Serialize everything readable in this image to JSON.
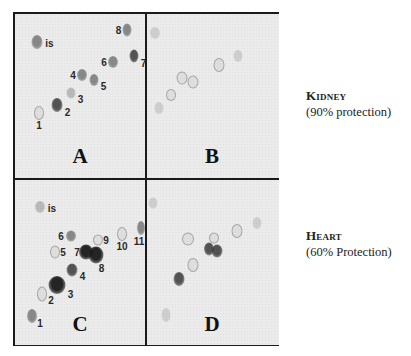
{
  "figure": {
    "panels": [
      {
        "label": "A",
        "spots": [
          {
            "id": "is",
            "label": "is",
            "x": 22,
            "y": 28,
            "w": 11,
            "h": 14,
            "shade": "medium"
          },
          {
            "id": "1",
            "label": "1",
            "x": 24,
            "y": 99,
            "w": 8,
            "h": 12,
            "shade": "ring"
          },
          {
            "id": "2",
            "label": "2",
            "x": 42,
            "y": 91,
            "w": 11,
            "h": 14,
            "shade": "dark"
          },
          {
            "id": "3",
            "label": "3",
            "x": 56,
            "y": 79,
            "w": 9,
            "h": 11,
            "shade": "light"
          },
          {
            "id": "4",
            "label": "4",
            "x": 67,
            "y": 61,
            "w": 10,
            "h": 12,
            "shade": "medium"
          },
          {
            "id": "5",
            "label": "5",
            "x": 79,
            "y": 66,
            "w": 9,
            "h": 12,
            "shade": "medium"
          },
          {
            "id": "6",
            "label": "6",
            "x": 98,
            "y": 48,
            "w": 10,
            "h": 12,
            "shade": "medium"
          },
          {
            "id": "7",
            "label": "7",
            "x": 119,
            "y": 42,
            "w": 9,
            "h": 13,
            "shade": "dark"
          },
          {
            "id": "8",
            "label": "8",
            "x": 112,
            "y": 16,
            "w": 9,
            "h": 13,
            "shade": "medium"
          }
        ]
      },
      {
        "label": "B",
        "spots": [
          {
            "x": 8,
            "y": 19,
            "w": 10,
            "h": 12,
            "shade": "faint"
          },
          {
            "x": 12,
            "y": 94,
            "w": 9,
            "h": 12,
            "shade": "faint"
          },
          {
            "x": 24,
            "y": 81,
            "w": 8,
            "h": 10,
            "shade": "ring"
          },
          {
            "x": 35,
            "y": 64,
            "w": 9,
            "h": 11,
            "shade": "ring"
          },
          {
            "x": 46,
            "y": 68,
            "w": 9,
            "h": 11,
            "shade": "ring"
          },
          {
            "x": 72,
            "y": 51,
            "w": 9,
            "h": 12,
            "shade": "ring"
          },
          {
            "x": 91,
            "y": 42,
            "w": 9,
            "h": 12,
            "shade": "faint"
          }
        ]
      },
      {
        "label": "C",
        "spots": [
          {
            "id": "is",
            "label": "is",
            "x": 25,
            "y": 27,
            "w": 10,
            "h": 12,
            "shade": "light"
          },
          {
            "id": "1",
            "label": "1",
            "x": 17,
            "y": 136,
            "w": 10,
            "h": 14,
            "shade": "medium"
          },
          {
            "id": "2",
            "label": "2",
            "x": 27,
            "y": 114,
            "w": 8,
            "h": 13,
            "shade": "ring"
          },
          {
            "id": "3",
            "label": "3",
            "x": 42,
            "y": 105,
            "w": 17,
            "h": 18,
            "shade": "black"
          },
          {
            "id": "4",
            "label": "4",
            "x": 57,
            "y": 90,
            "w": 11,
            "h": 13,
            "shade": "dark"
          },
          {
            "id": "5",
            "label": "5",
            "x": 40,
            "y": 72,
            "w": 8,
            "h": 11,
            "shade": "ring"
          },
          {
            "id": "6",
            "label": "6",
            "x": 56,
            "y": 56,
            "w": 10,
            "h": 11,
            "shade": "medium"
          },
          {
            "id": "7",
            "label": "7",
            "x": 71,
            "y": 72,
            "w": 14,
            "h": 15,
            "shade": "black"
          },
          {
            "id": "8",
            "label": "8",
            "x": 81,
            "y": 75,
            "w": 15,
            "h": 17,
            "shade": "black"
          },
          {
            "id": "9",
            "label": "9",
            "x": 83,
            "y": 60,
            "w": 8,
            "h": 9,
            "shade": "ring"
          },
          {
            "id": "10",
            "label": "10",
            "x": 107,
            "y": 54,
            "w": 8,
            "h": 12,
            "shade": "ring"
          },
          {
            "id": "11",
            "label": "11",
            "x": 126,
            "y": 48,
            "w": 8,
            "h": 14,
            "shade": "medium"
          }
        ]
      },
      {
        "label": "D",
        "spots": [
          {
            "x": 6,
            "y": 23,
            "w": 9,
            "h": 11,
            "shade": "faint"
          },
          {
            "x": 19,
            "y": 135,
            "w": 9,
            "h": 14,
            "shade": "faint"
          },
          {
            "x": 41,
            "y": 59,
            "w": 10,
            "h": 11,
            "shade": "ring"
          },
          {
            "x": 62,
            "y": 69,
            "w": 10,
            "h": 13,
            "shade": "dark"
          },
          {
            "x": 70,
            "y": 71,
            "w": 11,
            "h": 13,
            "shade": "dark"
          },
          {
            "x": 67,
            "y": 58,
            "w": 8,
            "h": 9,
            "shade": "ring"
          },
          {
            "x": 46,
            "y": 85,
            "w": 9,
            "h": 12,
            "shade": "ring"
          },
          {
            "x": 32,
            "y": 99,
            "w": 11,
            "h": 14,
            "shade": "dark"
          },
          {
            "x": 90,
            "y": 51,
            "w": 9,
            "h": 12,
            "shade": "ring"
          },
          {
            "x": 110,
            "y": 43,
            "w": 9,
            "h": 12,
            "shade": "faint"
          }
        ]
      }
    ],
    "captions": [
      {
        "title": "Kidney",
        "subtitle": "(90% protection)"
      },
      {
        "title": "Heart",
        "subtitle": "(60% Protection)"
      }
    ]
  },
  "shades": {
    "black": "rgba(20,20,20,0.92)",
    "dark": "rgba(45,45,45,0.8)",
    "medium": "rgba(70,70,70,0.6)",
    "light": "rgba(110,110,110,0.4)",
    "faint": "rgba(140,140,140,0.3)",
    "ring": "rgba(200,200,200,0.35)"
  }
}
